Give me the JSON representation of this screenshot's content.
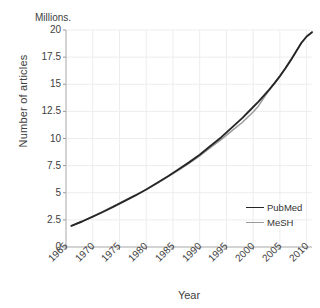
{
  "chart_data": {
    "type": "line",
    "title": "",
    "unit_label": "Millions.",
    "xlabel": "Year",
    "ylabel": "Number of articles",
    "xlim": [
      1965,
      2011
    ],
    "ylim": [
      0,
      20
    ],
    "xticks": [
      "1965",
      "1970",
      "1975",
      "1980",
      "1985",
      "1990",
      "1995",
      "2000",
      "2005",
      "2010"
    ],
    "xtick_values": [
      1965,
      1970,
      1975,
      1980,
      1985,
      1990,
      1995,
      2000,
      2005,
      2010
    ],
    "yticks": [
      "0",
      "2.5",
      "5",
      "7.5",
      "10",
      "12.5",
      "15",
      "17.5",
      "20"
    ],
    "ytick_values": [
      0,
      2.5,
      5,
      7.5,
      10,
      12.5,
      15,
      17.5,
      20
    ],
    "grid": true,
    "legend_position": "inside-lower-right",
    "x": [
      1966,
      1968,
      1970,
      1972,
      1974,
      1976,
      1978,
      1980,
      1982,
      1984,
      1986,
      1988,
      1990,
      1992,
      1994,
      1996,
      1998,
      2000,
      2001,
      2002,
      2003,
      2004,
      2005,
      2006,
      2007,
      2008,
      2009,
      2010,
      2011
    ],
    "series": [
      {
        "name": "PubMed",
        "color": "#262626",
        "values": [
          1.95,
          2.35,
          2.8,
          3.25,
          3.75,
          4.25,
          4.75,
          5.3,
          5.9,
          6.5,
          7.15,
          7.8,
          8.5,
          9.3,
          10.1,
          11.0,
          11.9,
          12.9,
          13.4,
          13.95,
          14.5,
          15.1,
          15.75,
          16.45,
          17.2,
          18.0,
          18.8,
          19.4,
          19.8
        ]
      },
      {
        "name": "MeSH",
        "color": "#9a9a9a",
        "values": [
          1.95,
          2.35,
          2.8,
          3.3,
          3.8,
          4.3,
          4.8,
          5.3,
          5.85,
          6.45,
          7.05,
          7.7,
          8.4,
          9.15,
          9.9,
          10.7,
          11.5,
          12.45,
          13.0,
          13.75,
          14.45,
          15.1,
          15.75,
          16.45,
          17.2,
          18.0,
          18.8,
          19.4,
          19.8
        ]
      }
    ]
  },
  "legend": {
    "items": [
      {
        "label": "PubMed",
        "color": "#262626"
      },
      {
        "label": "MeSH",
        "color": "#9a9a9a"
      }
    ]
  }
}
